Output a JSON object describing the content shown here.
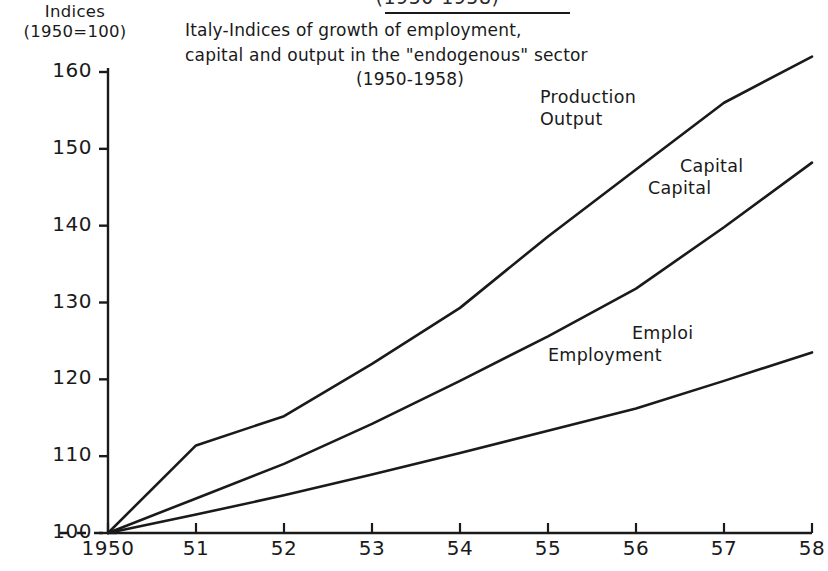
{
  "header": {
    "cutoff_text": "(1950-1958)"
  },
  "axis_unit": {
    "line1": "Indices",
    "line2": "(1950=100)"
  },
  "title": {
    "line1": "Italy-Indices of growth of employment,",
    "line2": "capital and output in the \"endogenous\" sector",
    "line3": "(1950-1958)"
  },
  "labels": {
    "production": {
      "top": "Production",
      "bottom": "Output"
    },
    "capital": {
      "top": "Capital",
      "bottom": "Capital"
    },
    "employment": {
      "top": "Emploi",
      "bottom": "Employment"
    }
  },
  "chart_data": {
    "type": "line",
    "title": "Italy-Indices of growth of employment, capital and output in the \"endogenous\" sector (1950-1958)",
    "xlabel": "",
    "ylabel": "Indices (1950=100)",
    "x": [
      1950,
      1951,
      1952,
      1953,
      1954,
      1955,
      1956,
      1957,
      1958
    ],
    "xticklabels": [
      "1950",
      "51",
      "52",
      "53",
      "54",
      "55",
      "56",
      "57",
      "58"
    ],
    "yticks": [
      100,
      110,
      120,
      130,
      140,
      150,
      160
    ],
    "yticklabels": [
      "100",
      "110",
      "120",
      "130",
      "140",
      "150",
      "160"
    ],
    "ylim": [
      100,
      160
    ],
    "xlim": [
      1950,
      1958
    ],
    "grid": false,
    "legend": "inline-annotations",
    "baseline_dashed_at": 100,
    "series": [
      {
        "name": "Production Output",
        "label_top": "Production",
        "label_bottom": "Output",
        "values": [
          100,
          111.4,
          115.2,
          122.0,
          129.3,
          138.6,
          147.3,
          156.0,
          162.0
        ]
      },
      {
        "name": "Capital",
        "label_top": "Capital",
        "label_bottom": "Capital",
        "values": [
          100,
          104.5,
          109.0,
          114.2,
          119.8,
          125.6,
          131.8,
          139.8,
          148.2
        ]
      },
      {
        "name": "Emploi Employment",
        "label_top": "Emploi",
        "label_bottom": "Employment",
        "values": [
          100,
          102.4,
          104.9,
          107.6,
          110.4,
          113.3,
          116.2,
          119.8,
          123.5
        ]
      }
    ]
  }
}
